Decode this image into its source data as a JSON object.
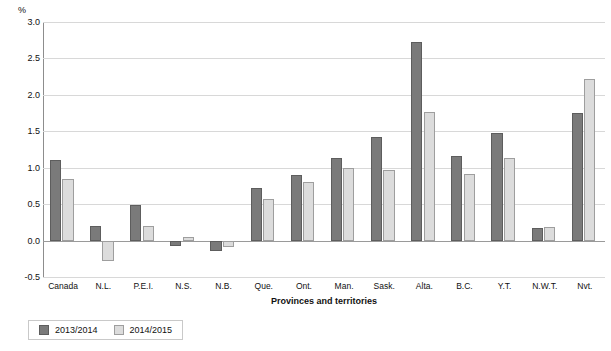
{
  "chart_data": {
    "type": "bar",
    "title": "",
    "xlabel": "Provinces and territories",
    "ylabel": "%",
    "ylim": [
      -0.5,
      3.0
    ],
    "yticks": [
      "-0.5",
      "0.0",
      "0.5",
      "1.0",
      "1.5",
      "2.0",
      "2.5",
      "3.0"
    ],
    "grid": true,
    "legend_position": "bottom-left",
    "categories": [
      "Canada",
      "N.L.",
      "P.E.I.",
      "N.S.",
      "N.B.",
      "Que.",
      "Ont.",
      "Man.",
      "Sask.",
      "Alta.",
      "B.C.",
      "Y.T.",
      "N.W.T.",
      "Nvt."
    ],
    "series": [
      {
        "name": "2013/2014",
        "color": "#7a7a7a",
        "values": [
          1.1,
          0.2,
          0.49,
          -0.07,
          -0.14,
          0.72,
          0.9,
          1.14,
          1.42,
          2.72,
          1.16,
          1.47,
          0.17,
          1.75
        ]
      },
      {
        "name": "2014/2015",
        "color": "#dcdcdc",
        "values": [
          0.85,
          -0.28,
          0.2,
          0.05,
          -0.09,
          0.57,
          0.81,
          1.0,
          0.97,
          1.77,
          0.91,
          1.13,
          0.19,
          2.22
        ]
      }
    ]
  },
  "legend": {
    "items": [
      {
        "label": "2013/2014"
      },
      {
        "label": "2014/2015"
      }
    ]
  }
}
